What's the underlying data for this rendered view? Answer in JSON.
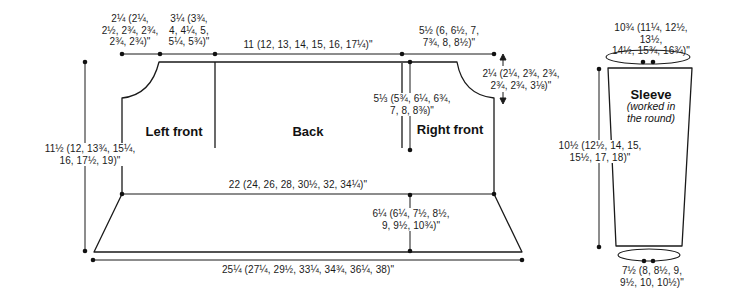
{
  "diagram": {
    "colors": {
      "ink": "#1a1a1a",
      "background": "#ffffff"
    },
    "body": {
      "sections": {
        "left_front": "Left front",
        "back": "Back",
        "right_front": "Right front"
      },
      "measurements": {
        "left_neck_width": "2¼ (2¼,\n2½, 2¾, 2¾,\n2¾, 2¾)\"",
        "shoulder_width": "3¼ (3¾,\n4, 4¼, 5,\n5¼, 5¾)\"",
        "back_width": "11 (12, 13, 14, 15, 16, 17¼)\"",
        "right_front_width": "5½ (6, 6½, 7,\n7¾, 8, 8½)\"",
        "right_neck_depth": "2¼ (2¼, 2¾, 2¾,\n2¾, 2¾, 3⅛)\"",
        "armhole_depth": "5⅓ (5¾, 6¼, 6¾,\n7, 8, 8⅜)\"",
        "body_length": "11½ (12, 13¾, 15¼,\n16, 17½, 19)\"",
        "chest_width": "22 (24, 26, 28, 30½, 32, 34¼)\"",
        "lower_depth": "6¼ (6¼, 7½, 8½,\n9, 9½, 10¾)\"",
        "hem_width": "25¼ (27¼, 29½, 33¼, 34¾, 36¼, 38)\""
      }
    },
    "sleeve": {
      "label": "Sleeve",
      "note": "(worked in\nthe round)",
      "measurements": {
        "top_circumference": "10¾ (11¼, 12½, 13½,\n14½, 15¾, 16¾)\"",
        "length": "10½ (12½, 14, 15,\n15½, 17, 18)\"",
        "cuff_circumference": "7½ (8, 8½, 9,\n9½, 10, 10½)\""
      }
    }
  }
}
